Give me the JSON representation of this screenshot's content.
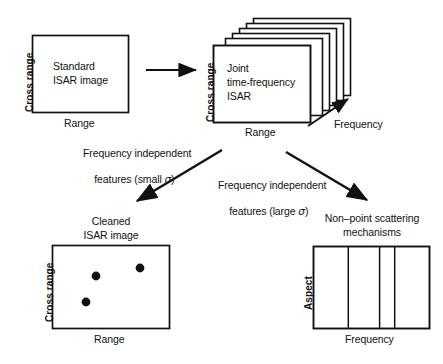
{
  "figure": {
    "background_color": "#ffffff",
    "stroke_color": "#111111"
  },
  "nodes": {
    "standard_isar": {
      "label_line1": "Standard",
      "label_line2": "ISAR image",
      "y_axis_label": "Cross range",
      "x_axis_label": "Range"
    },
    "joint_tf_isar": {
      "label_line1": "Joint",
      "label_line2": "time-frequency",
      "label_line3": "ISAR",
      "y_axis_label": "Cross range",
      "x_axis_label": "Range",
      "depth_axis_label": "Frequency",
      "stack_count": 6
    },
    "cleaned_isar": {
      "caption_line1": "Cleaned",
      "caption_line2": "ISAR image",
      "y_axis_label": "Cross range",
      "x_axis_label": "Range",
      "scatterers": [
        {
          "x_pct": 37,
          "y_pct": 37
        },
        {
          "x_pct": 75,
          "y_pct": 27
        },
        {
          "x_pct": 29,
          "y_pct": 68
        }
      ]
    },
    "non_point_scattering": {
      "caption_line1": "Non–point scattering",
      "caption_line2": "mechanisms",
      "y_axis_label": "Aspect",
      "x_axis_label": "Frequency",
      "divider_pcts": [
        30,
        57,
        70
      ]
    }
  },
  "flows": {
    "transform_arrow": {
      "name": "standard-to-joint"
    },
    "small_sigma": {
      "line1": "Frequency independent",
      "line2_prefix": "features (small ",
      "sigma": "σ",
      "line2_suffix": ")"
    },
    "large_sigma": {
      "line1": "Frequency independent",
      "line2_prefix": "features (large ",
      "sigma": "σ",
      "line2_suffix": ")"
    }
  }
}
